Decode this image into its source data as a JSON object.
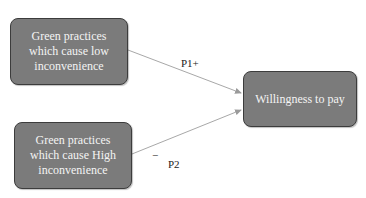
{
  "diagram": {
    "nodes": [
      {
        "id": "low",
        "label_lines": [
          "Green practices",
          "which cause low",
          "inconvenience"
        ]
      },
      {
        "id": "high",
        "label_lines": [
          "Green practices",
          "which cause High",
          "inconvenience"
        ]
      },
      {
        "id": "wtp",
        "label": "Willingness to pay"
      }
    ],
    "edges": [
      {
        "from": "low",
        "to": "wtp",
        "label": "P1+"
      },
      {
        "from": "high",
        "to": "wtp",
        "label": "P2",
        "sign": "−"
      }
    ],
    "colors": {
      "box_fill": "#7b7b7b",
      "box_border": "#3c3c3c",
      "box_text": "#f4f4f4",
      "arrow": "#a8a8a8"
    }
  }
}
